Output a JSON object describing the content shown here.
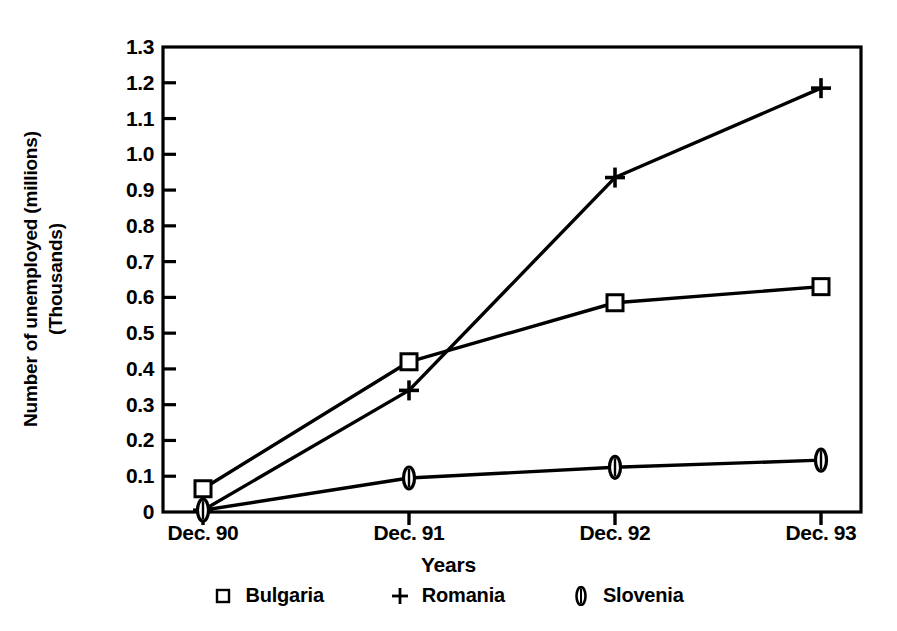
{
  "chart_data": {
    "type": "line",
    "title": "",
    "xlabel": "Years",
    "ylabel_line1": "Number of unemployed (millions)",
    "ylabel_line2": "(Thousands)",
    "categories": [
      "Dec. 90",
      "Dec. 91",
      "Dec. 92",
      "Dec. 93"
    ],
    "ylim": [
      0,
      1.3
    ],
    "yticks": [
      "1.3",
      "1.2",
      "1.1",
      "1.0",
      "0.9",
      "0.8",
      "0.7",
      "0.6",
      "0.5",
      "0.4",
      "0.3",
      "0.2",
      "0.1",
      "0"
    ],
    "ytick_values": [
      1.3,
      1.2,
      1.1,
      1.0,
      0.9,
      0.8,
      0.7,
      0.6,
      0.5,
      0.4,
      0.3,
      0.2,
      0.1,
      0
    ],
    "grid": false,
    "legend_position": "bottom",
    "series": [
      {
        "name": "Bulgaria",
        "marker": "square",
        "values": [
          0.065,
          0.42,
          0.585,
          0.63
        ]
      },
      {
        "name": "Romania",
        "marker": "plus",
        "values": [
          0.005,
          0.34,
          0.935,
          1.185
        ]
      },
      {
        "name": "Slovenia",
        "marker": "narrow-oval",
        "values": [
          0.005,
          0.095,
          0.125,
          0.145
        ]
      }
    ]
  },
  "legend": {
    "items": [
      {
        "label": "Bulgaria",
        "marker": "square-marker-icon"
      },
      {
        "label": "Romania",
        "marker": "plus-marker-icon"
      },
      {
        "label": "Slovenia",
        "marker": "oval-marker-icon"
      }
    ]
  },
  "axes": {
    "x_title": "Years",
    "y_title_line1": "Number of unemployed (millions)",
    "y_title_line2": "(Thousands)",
    "x_tick_labels": [
      "Dec. 90",
      "Dec. 91",
      "Dec. 92",
      "Dec. 93"
    ],
    "y_tick_labels": [
      "1.3",
      "1.2",
      "1.1",
      "1.0",
      "0.9",
      "0.8",
      "0.7",
      "0.6",
      "0.5",
      "0.4",
      "0.3",
      "0.2",
      "0.1",
      "0"
    ]
  },
  "colors": {
    "ink": "#000000",
    "background": "#ffffff"
  }
}
